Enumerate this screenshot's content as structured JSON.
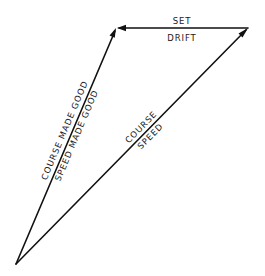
{
  "diagram": {
    "type": "vector-triangle",
    "colors": {
      "background": "#ffffff",
      "line": "#111111",
      "text": "#1a1a1a"
    },
    "vertices": {
      "origin": {
        "x": 16,
        "y": 264
      },
      "top_left": {
        "x": 116,
        "y": 28
      },
      "top_right": {
        "x": 248,
        "y": 28
      }
    },
    "vectors": [
      {
        "id": "course-speed",
        "from": "origin",
        "to": "top_right",
        "labels": {
          "above": "COURSE",
          "below": "SPEED"
        }
      },
      {
        "id": "set-drift",
        "from": "top_right",
        "to": "top_left",
        "labels": {
          "above": "SET",
          "below": "DRIFT"
        }
      },
      {
        "id": "course-made-good",
        "from": "origin",
        "to": "top_left",
        "labels": {
          "above": "COURSE MADE GOOD",
          "below": "SPEED MADE GOOD"
        }
      }
    ]
  }
}
